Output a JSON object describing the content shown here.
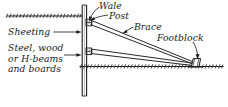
{
  "figure": {
    "type": "engineering-section-diagram",
    "ink_color": "#1d1d1d",
    "background_color": "#ffffff"
  },
  "labels": {
    "sheeting": "Sheeting",
    "material": "Steel, wood\nor H-beams\nand boards",
    "wale": "Wale",
    "post": "Post",
    "brace": "Brace",
    "footblock": "Footblock"
  },
  "parts": {
    "sheeting_label": "Sheeting",
    "material_lines": [
      "Steel, wood",
      "or H-beams",
      "and boards"
    ],
    "wale_label": "Wale",
    "post_label": "Post",
    "brace_label": "Brace",
    "footblock_label": "Footblock"
  }
}
